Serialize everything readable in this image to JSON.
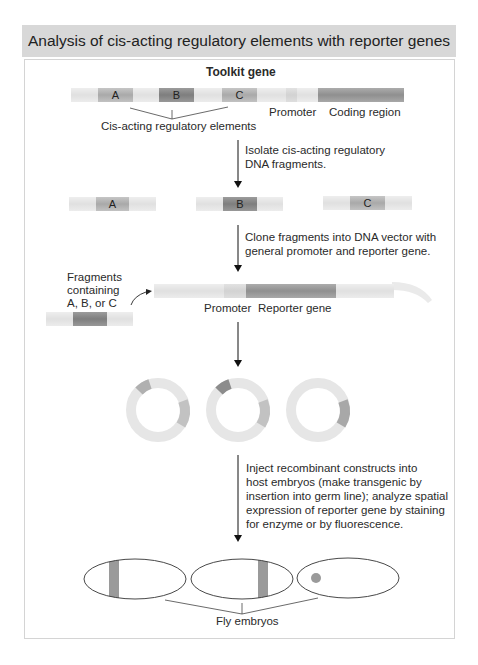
{
  "title": "Analysis of cis-acting regulatory elements with reporter genes",
  "toolkit_gene": {
    "label": "Toolkit gene",
    "segments": [
      "A",
      "B",
      "C"
    ],
    "promoter_label": "Promoter",
    "coding_label": "Coding region",
    "elements_label": "Cis-acting regulatory elements"
  },
  "steps": [
    {
      "text_lines": [
        "Isolate cis-acting regulatory",
        "DNA fragments."
      ]
    },
    {
      "text_lines": [
        "Clone fragments into DNA vector with",
        "general promoter and reporter gene."
      ]
    },
    {
      "text_lines": [
        "Inject recombinant constructs into",
        "host embryos (make transgenic by",
        "insertion into germ line); analyze spatial",
        "expression of reporter gene by staining",
        "for enzyme or by fluorescence."
      ]
    }
  ],
  "fragments": [
    "A",
    "B",
    "C"
  ],
  "vector": {
    "fragment_label_lines": [
      "Fragments",
      "containing",
      "A, B, or C"
    ],
    "promoter_label": "Promoter",
    "reporter_label": "Reporter gene"
  },
  "embryos_label": "Fly embryos",
  "colors": {
    "header_bg": "#d8d8d8",
    "light_dna": "#e6e6e6",
    "element_a": "#b0b0b0",
    "element_b": "#888888",
    "element_c": "#a0a0a0",
    "stain": "#999999"
  }
}
